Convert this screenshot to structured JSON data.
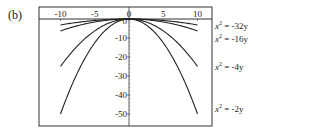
{
  "panel_label": "(b)",
  "chart_data": {
    "type": "line",
    "title": "",
    "xlabel": "",
    "ylabel": "",
    "xlim": [
      -10,
      10
    ],
    "ylim": [
      -50,
      0
    ],
    "x_ticks": [
      "-10",
      "-5",
      "0",
      "5",
      "10"
    ],
    "y_ticks": [
      "0",
      "-10",
      "-20",
      "-30",
      "-40",
      "-50"
    ],
    "grid": false,
    "legend_position": "right (inline labels)",
    "series": [
      {
        "name": "x² = -32y",
        "label_main": "x",
        "label_rest": " = -32y",
        "a": 32
      },
      {
        "name": "x² = -16y",
        "label_main": "x",
        "label_rest": " = -16y",
        "a": 16
      },
      {
        "name": "x² = -4y",
        "label_main": "x",
        "label_rest": " = -4y",
        "a": 4
      },
      {
        "name": "x² = -2y",
        "label_main": "x",
        "label_rest": " = -2y",
        "a": 2
      }
    ]
  }
}
